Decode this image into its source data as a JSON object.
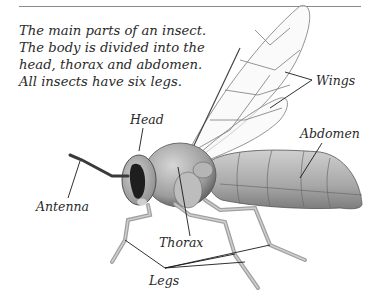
{
  "caption": {
    "lines": [
      "The main parts of an insect.",
      "The body is divided into the",
      "head, thorax and abdomen.",
      "All insects have six legs."
    ]
  },
  "labels": {
    "head": "Head",
    "wings": "Wings",
    "abdomen": "Abdomen",
    "antenna": "Antenna",
    "thorax": "Thorax",
    "legs": "Legs"
  },
  "colors": {
    "text": "#2a2a2a",
    "rule": "#8a8a8a",
    "body_light": "#c9c9c9",
    "body_mid": "#9a9a9a",
    "body_dark": "#2b2b2b",
    "wing_line": "#7a7a7a"
  }
}
